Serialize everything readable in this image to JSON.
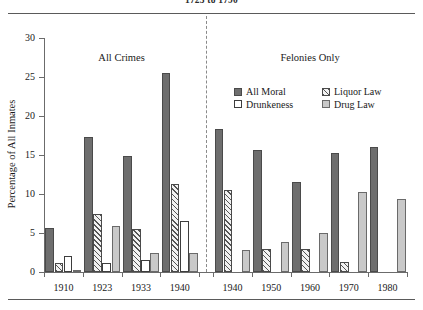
{
  "caption": {
    "text": "1725 to 1790"
  },
  "chart_data": {
    "type": "bar",
    "title": "1725 to 1790",
    "xlabel": "",
    "ylabel": "Percentage of All Inmates",
    "ylim": [
      0,
      30
    ],
    "yticks": [
      0,
      5,
      10,
      15,
      20,
      25,
      30
    ],
    "grid": false,
    "legend_position": "top-right",
    "panels": [
      {
        "name": "All Crimes",
        "categories": [
          "1910",
          "1923",
          "1933",
          "1940"
        ]
      },
      {
        "name": "Felonies Only",
        "categories": [
          "1940",
          "1950",
          "1960",
          "1970",
          "1980"
        ]
      }
    ],
    "categories": [
      "1910",
      "1923",
      "1933",
      "1940",
      "1940",
      "1950",
      "1960",
      "1970",
      "1980"
    ],
    "series": [
      {
        "name": "All Moral",
        "color": "#6e6e6e",
        "pattern": "solid",
        "values": [
          5.6,
          17.3,
          14.9,
          25.5,
          18.3,
          15.6,
          11.6,
          15.2,
          16.0
        ]
      },
      {
        "name": "Liquor Law",
        "color": "#f2f2f2",
        "pattern": "hatch",
        "values": [
          1.2,
          7.4,
          5.5,
          11.3,
          10.5,
          2.9,
          3.0,
          1.3,
          0
        ]
      },
      {
        "name": "Drunkeness",
        "color": "#ffffff",
        "pattern": "open",
        "values": [
          2.1,
          1.2,
          1.6,
          6.5,
          0,
          0,
          0,
          0,
          0
        ]
      },
      {
        "name": "Drug Law",
        "color": "#c9c9c9",
        "pattern": "light",
        "values": [
          0.15,
          5.9,
          2.5,
          2.5,
          2.8,
          3.8,
          5.0,
          10.2,
          9.3
        ]
      }
    ]
  },
  "legend": {
    "items": [
      {
        "label": "All Moral",
        "swatch": "solid-dark-swatch"
      },
      {
        "label": "Liquor Law",
        "swatch": "hatched-swatch"
      },
      {
        "label": "Drunkeness",
        "swatch": "open-white-swatch"
      },
      {
        "label": "Drug Law",
        "swatch": "light-gray-swatch"
      }
    ]
  }
}
